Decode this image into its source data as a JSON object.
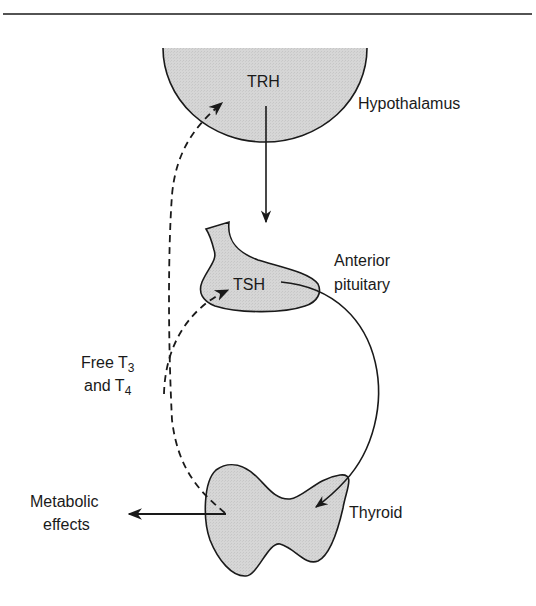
{
  "diagram": {
    "type": "endocrine-feedback-loop",
    "colors": {
      "organ_fill": "#d4d4d4",
      "stroke": "#1a1a1a",
      "background": "#ffffff"
    },
    "nodes": {
      "hypothalamus": {
        "label": "Hypothalamus",
        "hormone": "TRH"
      },
      "pituitary": {
        "label_line1": "Anterior",
        "label_line2": "pituitary",
        "hormone": "TSH"
      },
      "thyroid": {
        "label": "Thyroid"
      },
      "output": {
        "label_line1": "Metabolic",
        "label_line2": "effects"
      }
    },
    "feedback": {
      "label_line1_prefix": "Free T",
      "label_line1_sub": "3",
      "label_line2_prefix": "and T",
      "label_line2_sub": "4"
    },
    "edges": [
      {
        "from": "TRH",
        "to": "TSH",
        "style": "solid",
        "meaning": "stimulates"
      },
      {
        "from": "TSH",
        "to": "Thyroid",
        "style": "solid",
        "meaning": "stimulates"
      },
      {
        "from": "Thyroid",
        "to": "TSH",
        "style": "dashed",
        "meaning": "negative feedback"
      },
      {
        "from": "Thyroid",
        "to": "TRH",
        "style": "dashed",
        "meaning": "negative feedback"
      },
      {
        "from": "Thyroid",
        "to": "Metabolic effects",
        "style": "solid",
        "meaning": "output"
      }
    ]
  }
}
